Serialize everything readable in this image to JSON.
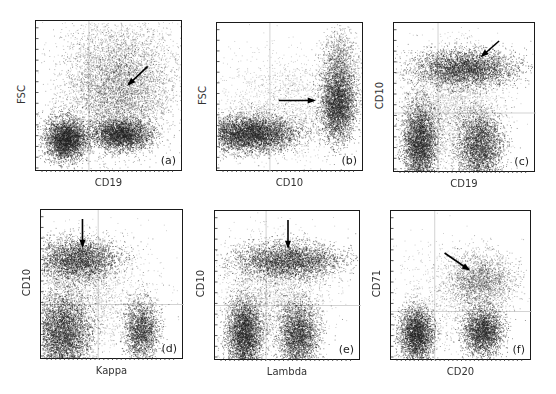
{
  "figure": {
    "type": "flow-cytometry-dotplot-grid",
    "rows": 2,
    "cols": 3
  },
  "chart_data": [
    {
      "type": "scatter",
      "panel_tag": "(a)",
      "xlabel": "CD19",
      "ylabel": "FSC",
      "box": [
        35,
        20,
        147,
        151
      ],
      "quadrant_lines": {
        "x": 0.36,
        "y": null
      },
      "populations": [
        {
          "name": "CD19- small cells",
          "cx": 0.2,
          "cy": 0.78,
          "sx": 0.07,
          "sy": 0.07,
          "n": 3500,
          "weight": "dense"
        },
        {
          "name": "CD19+ small cells",
          "cx": 0.58,
          "cy": 0.75,
          "sx": 0.1,
          "sy": 0.05,
          "n": 3000,
          "weight": "dense"
        },
        {
          "name": "CD19+ large blasts (arrow)",
          "cx": 0.55,
          "cy": 0.45,
          "sx": 0.18,
          "sy": 0.2,
          "n": 4500,
          "weight": "medium"
        },
        {
          "name": "diffuse",
          "cx": 0.6,
          "cy": 0.3,
          "sx": 0.2,
          "sy": 0.22,
          "n": 1500,
          "weight": "sparse"
        }
      ],
      "arrow": {
        "from": [
          0.76,
          0.3
        ],
        "to": [
          0.63,
          0.42
        ]
      }
    },
    {
      "type": "scatter",
      "panel_tag": "(b)",
      "xlabel": "CD10",
      "ylabel": "FSC",
      "box": [
        216,
        22,
        147,
        149
      ],
      "quadrant_lines": {
        "x": 0.36,
        "y": null
      },
      "populations": [
        {
          "name": "CD10- cells",
          "cx": 0.22,
          "cy": 0.74,
          "sx": 0.16,
          "sy": 0.06,
          "n": 5000,
          "weight": "dense"
        },
        {
          "name": "CD10+ blasts (arrow)",
          "cx": 0.82,
          "cy": 0.55,
          "sx": 0.06,
          "sy": 0.12,
          "n": 3200,
          "weight": "dense"
        },
        {
          "name": "CD10+ upper tail",
          "cx": 0.83,
          "cy": 0.3,
          "sx": 0.06,
          "sy": 0.13,
          "n": 1400,
          "weight": "medium"
        },
        {
          "name": "diffuse",
          "cx": 0.45,
          "cy": 0.55,
          "sx": 0.22,
          "sy": 0.18,
          "n": 1600,
          "weight": "sparse"
        }
      ],
      "arrow": {
        "from": [
          0.42,
          0.52
        ],
        "to": [
          0.66,
          0.52
        ]
      }
    },
    {
      "type": "scatter",
      "panel_tag": "(c)",
      "xlabel": "CD19",
      "ylabel": "CD10",
      "box": [
        393,
        22,
        142,
        150
      ],
      "quadrant_lines": {
        "x": 0.31,
        "y": 0.6
      },
      "populations": [
        {
          "name": "CD10+CD19+ blasts (arrow)",
          "cx": 0.5,
          "cy": 0.3,
          "sx": 0.18,
          "sy": 0.06,
          "n": 3500,
          "weight": "dense"
        },
        {
          "name": "CD10-CD19- cells",
          "cx": 0.18,
          "cy": 0.8,
          "sx": 0.06,
          "sy": 0.14,
          "n": 3800,
          "weight": "dense"
        },
        {
          "name": "CD10-CD19+ cells",
          "cx": 0.6,
          "cy": 0.82,
          "sx": 0.08,
          "sy": 0.12,
          "n": 3000,
          "weight": "dense"
        },
        {
          "name": "diffuse",
          "cx": 0.4,
          "cy": 0.55,
          "sx": 0.18,
          "sy": 0.2,
          "n": 2500,
          "weight": "sparse"
        }
      ],
      "arrow": {
        "from": [
          0.74,
          0.12
        ],
        "to": [
          0.62,
          0.22
        ]
      }
    },
    {
      "type": "scatter",
      "panel_tag": "(d)",
      "xlabel": "Kappa",
      "ylabel": "CD10",
      "box": [
        40,
        209,
        143,
        150
      ],
      "quadrant_lines": {
        "x": 0.4,
        "y": 0.63
      },
      "populations": [
        {
          "name": "CD10+ Kappa- blasts (arrow)",
          "cx": 0.25,
          "cy": 0.33,
          "sx": 0.14,
          "sy": 0.07,
          "n": 3200,
          "weight": "dense"
        },
        {
          "name": "CD10- Kappa- cells",
          "cx": 0.15,
          "cy": 0.82,
          "sx": 0.1,
          "sy": 0.14,
          "n": 4500,
          "weight": "dense"
        },
        {
          "name": "CD10- Kappa+ cells",
          "cx": 0.7,
          "cy": 0.8,
          "sx": 0.06,
          "sy": 0.1,
          "n": 2000,
          "weight": "dense"
        },
        {
          "name": "diffuse",
          "cx": 0.35,
          "cy": 0.55,
          "sx": 0.22,
          "sy": 0.2,
          "n": 1800,
          "weight": "sparse"
        }
      ],
      "arrow": {
        "from": [
          0.29,
          0.06
        ],
        "to": [
          0.29,
          0.24
        ]
      }
    },
    {
      "type": "scatter",
      "panel_tag": "(e)",
      "xlabel": "Lambda",
      "ylabel": "CD10",
      "box": [
        214,
        210,
        146,
        150
      ],
      "quadrant_lines": {
        "x": 0.35,
        "y": 0.63
      },
      "populations": [
        {
          "name": "CD10+ Lambda- blasts (arrow)",
          "cx": 0.5,
          "cy": 0.33,
          "sx": 0.18,
          "sy": 0.06,
          "n": 3300,
          "weight": "dense"
        },
        {
          "name": "CD10- Lambda- cells",
          "cx": 0.2,
          "cy": 0.82,
          "sx": 0.06,
          "sy": 0.12,
          "n": 3600,
          "weight": "dense"
        },
        {
          "name": "CD10- Lambda+ cells",
          "cx": 0.57,
          "cy": 0.82,
          "sx": 0.07,
          "sy": 0.11,
          "n": 2800,
          "weight": "dense"
        },
        {
          "name": "diffuse",
          "cx": 0.4,
          "cy": 0.55,
          "sx": 0.18,
          "sy": 0.2,
          "n": 2200,
          "weight": "sparse"
        }
      ],
      "arrow": {
        "from": [
          0.5,
          0.06
        ],
        "to": [
          0.5,
          0.24
        ]
      }
    },
    {
      "type": "scatter",
      "panel_tag": "(f)",
      "xlabel": "CD20",
      "ylabel": "CD71",
      "box": [
        390,
        210,
        141,
        150
      ],
      "quadrant_lines": {
        "x": 0.31,
        "y": 0.67
      },
      "populations": [
        {
          "name": "CD71+ blasts (arrow)",
          "cx": 0.63,
          "cy": 0.46,
          "sx": 0.12,
          "sy": 0.09,
          "n": 2000,
          "weight": "medium"
        },
        {
          "name": "CD20- CD71- cells",
          "cx": 0.18,
          "cy": 0.82,
          "sx": 0.06,
          "sy": 0.09,
          "n": 3000,
          "weight": "dense"
        },
        {
          "name": "CD20+ CD71- cells",
          "cx": 0.65,
          "cy": 0.8,
          "sx": 0.07,
          "sy": 0.08,
          "n": 2600,
          "weight": "dense"
        },
        {
          "name": "diffuse",
          "cx": 0.4,
          "cy": 0.6,
          "sx": 0.22,
          "sy": 0.2,
          "n": 900,
          "weight": "sparse"
        }
      ],
      "arrow": {
        "from": [
          0.38,
          0.28
        ],
        "to": [
          0.55,
          0.39
        ]
      }
    }
  ]
}
